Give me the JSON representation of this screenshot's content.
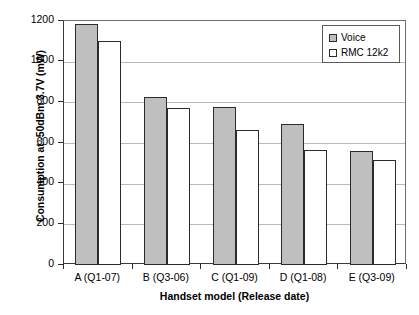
{
  "chart_data": {
    "type": "bar",
    "title": "",
    "xlabel": "Handset model (Release date)",
    "ylabel": "Consumption at -50dBm  3.7V (mW)",
    "categories": [
      "A (Q1-07)",
      "B (Q3-06)",
      "C (Q1-09)",
      "D (Q1-08)",
      "E (Q3-09)"
    ],
    "series": [
      {
        "name": "Voice",
        "color": "#bfbfbf",
        "values": [
          1185,
          825,
          775,
          695,
          560
        ]
      },
      {
        "name": "RMC 12k2",
        "color": "#ffffff",
        "values": [
          1100,
          770,
          665,
          565,
          515
        ]
      }
    ],
    "ylim": [
      0,
      1200
    ],
    "yticks": [
      0,
      200,
      400,
      600,
      800,
      1000,
      1200
    ],
    "ytick_labels": [
      "0",
      "200",
      "400",
      "600",
      "800",
      "1000",
      "1200"
    ],
    "grid": "horizontal",
    "legend_position": "top-right",
    "legend_entries": [
      "Voice",
      "RMC 12k2"
    ]
  }
}
